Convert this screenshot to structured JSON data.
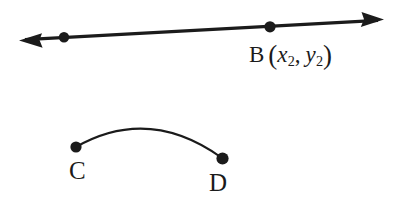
{
  "figure": {
    "background_color": "#ffffff",
    "ink_color": "#1b1b1b",
    "top_shape": {
      "kind": "double-headed-line",
      "description": "Line with arrowheads at both ends passing through two marked points",
      "line": {
        "x1": 19,
        "y1": 40,
        "x2": 384,
        "y2": 20,
        "stroke_width": 3
      },
      "arrowheads": [
        {
          "name": "left-arrowhead",
          "tip_x": 19,
          "tip_y": 40,
          "direction": "left"
        },
        {
          "name": "right-arrowhead",
          "tip_x": 384,
          "tip_y": 20,
          "direction": "right"
        }
      ],
      "points": [
        {
          "name": "point-a",
          "label": "",
          "cx": 64,
          "cy": 37,
          "r": 5
        },
        {
          "name": "point-b",
          "label": "B",
          "cx": 270,
          "cy": 27,
          "r": 5.5
        }
      ],
      "label_b": {
        "letter": "B",
        "open_paren": "(",
        "var_x": "x",
        "sub_x": "2",
        "comma": ",",
        "var_y": "y",
        "sub_y": "2",
        "close_paren": ")",
        "full_text": "B (x2, y2)"
      }
    },
    "bottom_shape": {
      "kind": "arc",
      "description": "Arc curving upward connecting endpoints C and D",
      "path": {
        "start_x": 76,
        "start_y": 147,
        "ctrl_x": 149,
        "ctrl_y": 106,
        "end_x": 222,
        "end_y": 158,
        "stroke_width": 2
      },
      "points": [
        {
          "name": "point-c",
          "label": "C",
          "cx": 76,
          "cy": 147,
          "r": 5.5
        },
        {
          "name": "point-d",
          "label": "D",
          "cx": 222,
          "cy": 158,
          "r": 6
        }
      ],
      "label_c": "C",
      "label_d": "D"
    }
  }
}
